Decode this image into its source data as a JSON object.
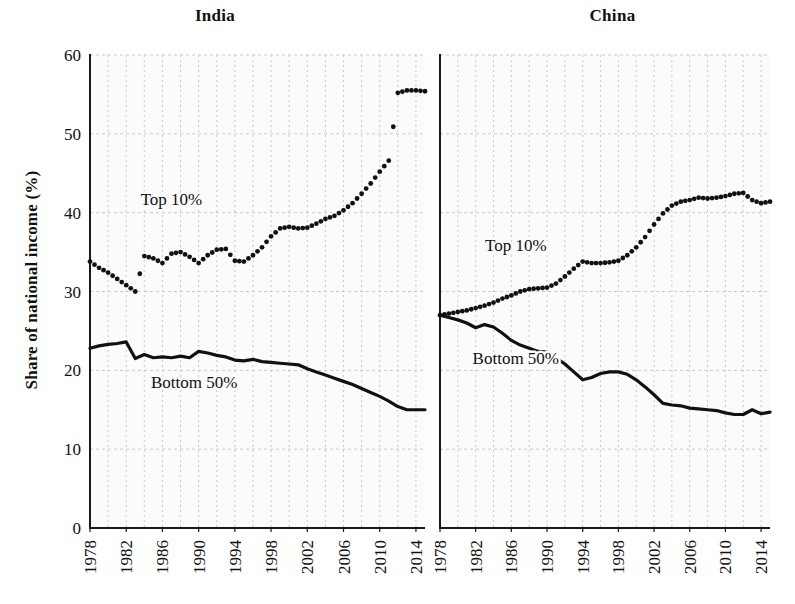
{
  "figure": {
    "ylabel": "Share of national income (%)",
    "panels": [
      {
        "title": "India",
        "key": "india"
      },
      {
        "title": "China",
        "key": "china"
      }
    ]
  },
  "chart_data": {
    "type": "line",
    "title": "",
    "subtitle": "",
    "xlabel": "",
    "ylabel": "Share of national income (%)",
    "ylim": [
      0,
      60
    ],
    "yticks": [
      0,
      10,
      20,
      30,
      40,
      50,
      60
    ],
    "xlim": [
      1978,
      2015
    ],
    "xticks": [
      1978,
      1982,
      1986,
      1990,
      1994,
      1998,
      2002,
      2006,
      2010,
      2014
    ],
    "xtick_labels": [
      "1978",
      "1982",
      "1986",
      "1990",
      "1994",
      "1998",
      "2002",
      "2006",
      "2010",
      "2014"
    ],
    "grid": true,
    "grid_style": "dotted",
    "grid_color": "#c9c9c9",
    "legend": "inline-annotations",
    "panels": [
      {
        "name": "India",
        "annotations": [
          {
            "text": "Top 10%",
            "x": 1987.0,
            "y": 41.0
          },
          {
            "text": "Bottom 50%",
            "x": 1989.5,
            "y": 17.8
          }
        ],
        "series": [
          {
            "name": "Top 10%",
            "style": "dotted",
            "x": [
              1978,
              1979,
              1980,
              1981,
              1982,
              1983,
              1984,
              1985,
              1986,
              1987,
              1988,
              1989,
              1990,
              1991,
              1992,
              1993,
              1994,
              1995,
              1996,
              1997,
              1998,
              1999,
              2000,
              2001,
              2002,
              2003,
              2004,
              2005,
              2006,
              2007,
              2008,
              2009,
              2010,
              2011,
              2012,
              2013,
              2014,
              2015
            ],
            "values": [
              33.8,
              33.0,
              32.4,
              31.6,
              30.8,
              30.0,
              34.5,
              34.2,
              33.6,
              34.8,
              35.0,
              34.4,
              33.6,
              34.6,
              35.3,
              35.4,
              33.9,
              33.8,
              34.6,
              35.6,
              37.0,
              38.0,
              38.2,
              38.0,
              38.1,
              38.6,
              39.2,
              39.6,
              40.3,
              41.2,
              42.4,
              43.7,
              45.2,
              46.6,
              48.2,
              50.1,
              52.0,
              53.6
            ]
          },
          {
            "name": "Bottom 50%",
            "style": "solid",
            "x": [
              1978,
              1979,
              1980,
              1981,
              1982,
              1983,
              1984,
              1985,
              1986,
              1987,
              1988,
              1989,
              1990,
              1991,
              1992,
              1993,
              1994,
              1995,
              1996,
              1997,
              1998,
              1999,
              2000,
              2001,
              2002,
              2003,
              2004,
              2005,
              2006,
              2007,
              2008,
              2009,
              2010,
              2011,
              2012,
              2013,
              2014,
              2015
            ],
            "values": [
              22.8,
              23.1,
              23.3,
              23.4,
              23.6,
              21.5,
              22.0,
              21.6,
              21.7,
              21.6,
              21.8,
              21.6,
              22.4,
              22.2,
              21.9,
              21.7,
              21.3,
              21.2,
              21.4,
              21.1,
              21.0,
              20.9,
              20.8,
              20.7,
              20.2,
              19.8,
              19.4,
              19.0,
              18.6,
              18.2,
              17.7,
              17.2,
              16.7,
              16.1,
              15.4,
              15.0,
              15.0,
              15.0
            ]
          }
        ],
        "extended_top10_tail": [
          55.2,
          55.5,
          55.5,
          55.4
        ]
      },
      {
        "name": "China",
        "annotations": [
          {
            "text": "Top 10%",
            "x": 1986.5,
            "y": 35.2
          },
          {
            "text": "Bottom 50%",
            "x": 1986.5,
            "y": 20.8
          }
        ],
        "series": [
          {
            "name": "Top 10%",
            "style": "dotted",
            "x": [
              1978,
              1979,
              1980,
              1981,
              1982,
              1983,
              1984,
              1985,
              1986,
              1987,
              1988,
              1989,
              1990,
              1991,
              1992,
              1993,
              1994,
              1995,
              1996,
              1997,
              1998,
              1999,
              2000,
              2001,
              2002,
              2003,
              2004,
              2005,
              2006,
              2007,
              2008,
              2009,
              2010,
              2011,
              2012,
              2013,
              2014,
              2015
            ],
            "values": [
              27.0,
              27.2,
              27.4,
              27.6,
              27.9,
              28.2,
              28.6,
              29.1,
              29.5,
              30.0,
              30.3,
              30.4,
              30.5,
              31.0,
              31.9,
              32.9,
              33.8,
              33.6,
              33.6,
              33.7,
              33.9,
              34.6,
              35.6,
              36.9,
              38.5,
              39.9,
              40.9,
              41.4,
              41.6,
              41.9,
              41.8,
              41.9,
              42.1,
              42.4,
              42.5,
              41.6,
              41.2,
              41.4
            ]
          },
          {
            "name": "Bottom 50%",
            "style": "solid",
            "x": [
              1978,
              1979,
              1980,
              1981,
              1982,
              1983,
              1984,
              1985,
              1986,
              1987,
              1988,
              1989,
              1990,
              1991,
              1992,
              1993,
              1994,
              1995,
              1996,
              1997,
              1998,
              1999,
              2000,
              2001,
              2002,
              2003,
              2004,
              2005,
              2006,
              2007,
              2008,
              2009,
              2010,
              2011,
              2012,
              2013,
              2014,
              2015
            ],
            "values": [
              27.0,
              26.7,
              26.4,
              26.0,
              25.4,
              25.8,
              25.5,
              24.7,
              23.8,
              23.2,
              22.8,
              22.4,
              22.3,
              21.6,
              20.8,
              19.8,
              18.8,
              19.1,
              19.6,
              19.8,
              19.8,
              19.5,
              18.8,
              17.9,
              16.9,
              15.8,
              15.6,
              15.5,
              15.2,
              15.1,
              15.0,
              14.9,
              14.6,
              14.4,
              14.4,
              15.0,
              14.5,
              14.7
            ]
          }
        ]
      }
    ]
  }
}
